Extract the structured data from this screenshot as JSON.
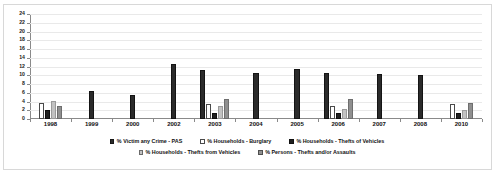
{
  "chart_data": {
    "type": "bar",
    "title": "",
    "subtitle": "",
    "xlabel": "",
    "ylabel": "",
    "ylim": [
      0,
      24
    ],
    "ytick_step": 2,
    "yticks": [
      "0",
      "2",
      "4",
      "6",
      "8",
      "10",
      "12",
      "14",
      "16",
      "18",
      "20",
      "22",
      "24"
    ],
    "grid": true,
    "legend_position": "bottom",
    "categories": [
      "1998",
      "1999",
      "2000",
      "2002",
      "2003",
      "2004",
      "2005",
      "2006",
      "2007",
      "2008",
      "2010"
    ],
    "series": [
      {
        "name": "% Victim any Crime - PAS",
        "color": "#2b2b2b",
        "swatch": "filled-dark",
        "values": [
          null,
          6.5,
          5.6,
          12.6,
          11.2,
          10.6,
          11.5,
          10.5,
          10.4,
          10.0,
          null
        ]
      },
      {
        "name": "% Households - Burglary",
        "color": "#ffffff",
        "swatch": "outline-white",
        "values": [
          3.6,
          null,
          null,
          null,
          3.4,
          null,
          null,
          2.9,
          null,
          null,
          3.4
        ]
      },
      {
        "name": "% Households - Thefts of Vehicles",
        "color": "#1f1f1f",
        "swatch": "filled-dark",
        "values": [
          2.0,
          null,
          null,
          null,
          1.4,
          null,
          null,
          1.4,
          null,
          null,
          1.3
        ]
      },
      {
        "name": "% Households - Thefts from Vehicles",
        "color": "#c2c2c2",
        "swatch": "filled-light-gray",
        "values": [
          4.1,
          null,
          null,
          null,
          3.0,
          null,
          null,
          2.4,
          null,
          null,
          2.1
        ]
      },
      {
        "name": "% Persons - Thefts and/or Assaults",
        "color": "#8f8f8f",
        "swatch": "filled-mid-gray",
        "values": [
          3.0,
          null,
          null,
          null,
          4.6,
          null,
          null,
          4.5,
          null,
          null,
          3.6
        ]
      }
    ]
  },
  "legend": {
    "row1": [
      "% Victim any Crime - PAS",
      "% Households - Burglary",
      "% Households - Thefts of Vehicles"
    ],
    "row2": [
      "% Households - Thefts from Vehicles",
      "% Persons - Thefts and/or Assaults"
    ]
  }
}
